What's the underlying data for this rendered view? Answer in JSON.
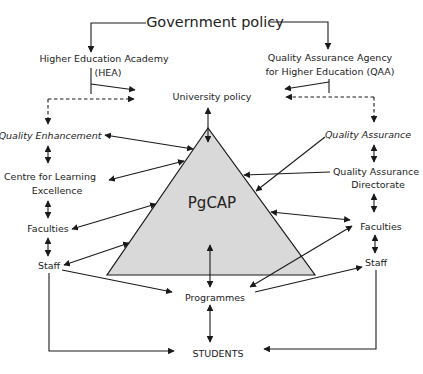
{
  "diagram": {
    "top": {
      "government_policy": "Government policy"
    },
    "agencies": {
      "hea": {
        "line1": "Higher Education Academy",
        "line2": "(HEA)"
      },
      "qaa": {
        "line1": "Quality Assurance Agency",
        "line2": "for Higher Education (QAA)"
      }
    },
    "university_policy": "University policy",
    "center": {
      "label": "PgCAP",
      "fill_color": "#d9d9d9"
    },
    "left_column": {
      "quality_enhancement": "Quality Enhancement",
      "centre_line1": "Centre for Learning",
      "centre_line2": "Excellence",
      "faculties": "Faculties",
      "staff": "Staff"
    },
    "right_column": {
      "quality_assurance": "Quality Assurance",
      "directorate_line1": "Quality Assurance",
      "directorate_line2": "Directorate",
      "faculties": "Faculties",
      "staff": "Staff"
    },
    "programmes": "Programmes",
    "students": "STUDENTS",
    "colors": {
      "ink": "#1a1a1a",
      "triangle_fill": "#d9d9d9",
      "background": "#ffffff"
    }
  }
}
